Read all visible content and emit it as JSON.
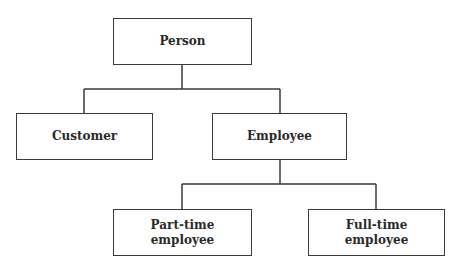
{
  "diagram": {
    "type": "hierarchy",
    "colors": {
      "line": "#3a3a3a",
      "text": "#2a2a2a",
      "background": "#ffffff"
    },
    "nodes": [
      {
        "id": "person",
        "label": "Person"
      },
      {
        "id": "customer",
        "label": "Customer"
      },
      {
        "id": "employee",
        "label": "Employee"
      },
      {
        "id": "part_time",
        "label": "Part-time\nemployee"
      },
      {
        "id": "full_time",
        "label": "Full-time\nemployee"
      }
    ],
    "edges": [
      {
        "from": "person",
        "to": "customer"
      },
      {
        "from": "person",
        "to": "employee"
      },
      {
        "from": "employee",
        "to": "part_time"
      },
      {
        "from": "employee",
        "to": "full_time"
      }
    ]
  }
}
